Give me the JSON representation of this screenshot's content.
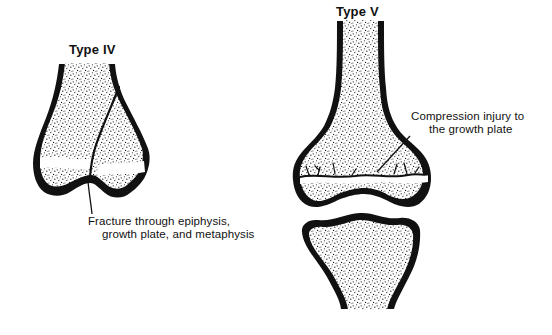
{
  "figure": {
    "type4": {
      "title": "Type IV",
      "caption_line1": "Fracture through epiphysis,",
      "caption_line2": "growth plate, and metaphysis"
    },
    "type5": {
      "title": "Type V",
      "caption_line1": "Compression injury to",
      "caption_line2": "the growth plate"
    },
    "colors": {
      "ink": "#111111",
      "background": "#ffffff",
      "growth_plate_band": "#ffffff"
    }
  }
}
